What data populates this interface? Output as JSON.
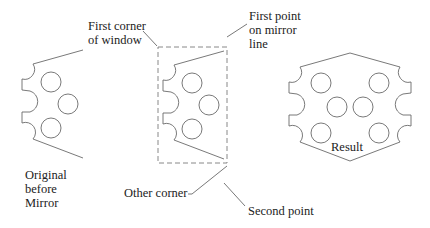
{
  "figure": {
    "labels": {
      "first_corner": "First corner\nof window",
      "first_point": "First point\non mirror\nline",
      "original": "Original\nbefore\nMirror",
      "other_corner": "Other corner",
      "second_point": "Second point",
      "result": "Result"
    },
    "colors": {
      "stroke": "#6a6a6a",
      "text": "#222222",
      "background": "#ffffff"
    },
    "parts": [
      {
        "name": "original",
        "holes": 3
      },
      {
        "name": "selected-copy",
        "holes": 3,
        "selection_window": "dashed"
      },
      {
        "name": "result",
        "holes": 6
      }
    ]
  }
}
